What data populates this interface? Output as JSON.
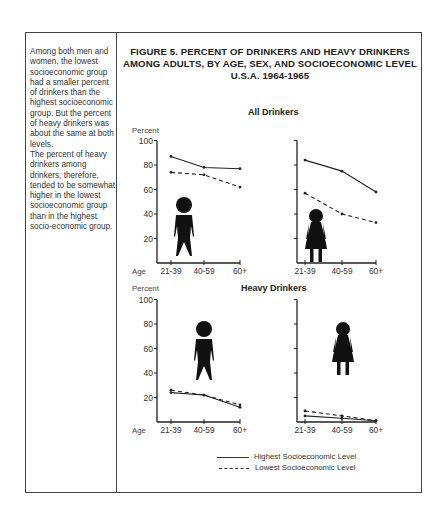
{
  "sidebar": {
    "paragraphs": [
      "Among both men and women, the lowest socioeconomic group had a smaller percent of drinkers than the highest socioeconomic group. But the percent of heavy drinkers was about the same at both levels.",
      "The percent of heavy drinkers among drinkers, therefore, tended to be somewhat higher in the lowest socioeconomic group than in the highest socio-economic group."
    ]
  },
  "figure": {
    "title_lines": [
      "FIGURE 5.  PERCENT OF DRINKERS AND HEAVY DRINKERS",
      "AMONG ADULTS, BY AGE, SEX, AND SOCIOECONOMIC LEVEL",
      "U.S.A. 1964-1965"
    ],
    "section_all": "All Drinkers",
    "section_heavy": "Heavy Drinkers",
    "ylabel": "Percent",
    "xlabel": "Age",
    "yticks": [
      "100",
      "80",
      "60",
      "40",
      "20"
    ],
    "xticks": [
      "21-39",
      "40-59",
      "60+"
    ],
    "legend": {
      "highest": "Highest Socioeconomic Level",
      "lowest": "Lowest Socioeconomic Level"
    }
  },
  "chart_data": [
    {
      "type": "line",
      "title": "All Drinkers - Men",
      "categories": [
        "21-39",
        "40-59",
        "60+"
      ],
      "xlabel": "Age",
      "ylabel": "Percent",
      "ylim": [
        0,
        100
      ],
      "series": [
        {
          "name": "Highest Socioeconomic Level",
          "style": "solid",
          "values": [
            87,
            78,
            77
          ]
        },
        {
          "name": "Lowest Socioeconomic Level",
          "style": "dashed",
          "values": [
            74,
            72,
            62
          ]
        }
      ]
    },
    {
      "type": "line",
      "title": "All Drinkers - Women",
      "categories": [
        "21-39",
        "40-59",
        "60+"
      ],
      "xlabel": "Age",
      "ylabel": "Percent",
      "ylim": [
        0,
        100
      ],
      "series": [
        {
          "name": "Highest Socioeconomic Level",
          "style": "solid",
          "values": [
            84,
            75,
            58
          ]
        },
        {
          "name": "Lowest Socioeconomic Level",
          "style": "dashed",
          "values": [
            57,
            40,
            33
          ]
        }
      ]
    },
    {
      "type": "line",
      "title": "Heavy Drinkers - Men",
      "categories": [
        "21-39",
        "40-59",
        "60+"
      ],
      "xlabel": "Age",
      "ylabel": "Percent",
      "ylim": [
        0,
        100
      ],
      "series": [
        {
          "name": "Highest Socioeconomic Level",
          "style": "solid",
          "values": [
            24,
            22,
            12
          ]
        },
        {
          "name": "Lowest Socioeconomic Level",
          "style": "dashed",
          "values": [
            26,
            22,
            14
          ]
        }
      ]
    },
    {
      "type": "line",
      "title": "Heavy Drinkers - Women",
      "categories": [
        "21-39",
        "40-59",
        "60+"
      ],
      "xlabel": "Age",
      "ylabel": "Percent",
      "ylim": [
        0,
        100
      ],
      "series": [
        {
          "name": "Highest Socioeconomic Level",
          "style": "solid",
          "values": [
            5,
            3,
            1
          ]
        },
        {
          "name": "Lowest Socioeconomic Level",
          "style": "dashed",
          "values": [
            9,
            5,
            1
          ]
        }
      ]
    }
  ]
}
